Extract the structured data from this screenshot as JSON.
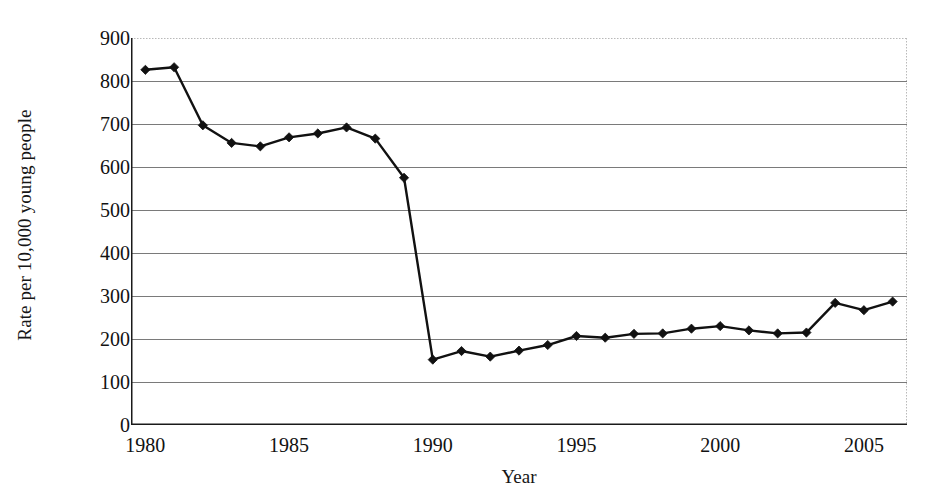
{
  "chart_data": {
    "type": "line",
    "title": "",
    "xlabel": "Year",
    "ylabel": "Rate per 10,000 young people",
    "xlim": [
      1979.5,
      2006.5
    ],
    "ylim": [
      0,
      900
    ],
    "ytick_step": 100,
    "grid": "horizontal",
    "legend": "none",
    "marker": "diamond",
    "line_color": "#111111",
    "marker_color": "#111111",
    "grid_color": "#7a7a7a",
    "axis_color": "#1a1a1a",
    "x": [
      1980,
      1981,
      1982,
      1983,
      1984,
      1985,
      1986,
      1987,
      1988,
      1989,
      1990,
      1991,
      1992,
      1993,
      1994,
      1995,
      1996,
      1997,
      1998,
      1999,
      2000,
      2001,
      2002,
      2003,
      2004,
      2005,
      2006
    ],
    "values": [
      826,
      832,
      697,
      656,
      648,
      669,
      678,
      692,
      666,
      575,
      152,
      172,
      159,
      173,
      186,
      207,
      203,
      212,
      213,
      224,
      230,
      220,
      213,
      215,
      284,
      267,
      287
    ],
    "y_tick_labels": [
      "900",
      "800",
      "700",
      "600",
      "500",
      "400",
      "300",
      "200",
      "100",
      "0"
    ],
    "y_tick_values": [
      900,
      800,
      700,
      600,
      500,
      400,
      300,
      200,
      100,
      0
    ],
    "x_tick_labels": [
      "1980",
      "1985",
      "1990",
      "1995",
      "2000",
      "2005"
    ],
    "x_tick_values": [
      1980,
      1985,
      1990,
      1995,
      2000,
      2005
    ],
    "x_minor_ticks": [
      1981,
      1982,
      1983,
      1984,
      1986,
      1987,
      1988,
      1989,
      1991,
      1992,
      1993,
      1994,
      1996,
      1997,
      1998,
      1999,
      2001,
      2002,
      2003,
      2004,
      2006
    ]
  }
}
